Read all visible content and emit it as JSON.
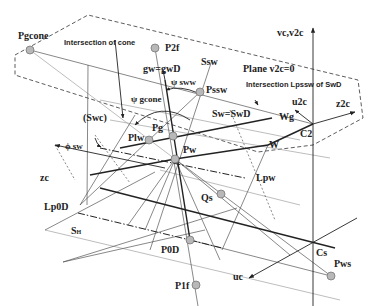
{
  "figure": {
    "type": "3D geometry diagram of cone / gear tooth surfaces",
    "points": [
      {
        "id": "Pgcone",
        "label": "Pgcone"
      },
      {
        "id": "P2f",
        "label": "P2f"
      },
      {
        "id": "Pssw",
        "label": "Pssw"
      },
      {
        "id": "Pg",
        "label": "Pg"
      },
      {
        "id": "Plw",
        "label": "Plw"
      },
      {
        "id": "Pw",
        "label": "Pw"
      },
      {
        "id": "Qs",
        "label": "Qs"
      },
      {
        "id": "P0D",
        "label": "P0D"
      },
      {
        "id": "P1f",
        "label": "P1f"
      },
      {
        "id": "Pws",
        "label": "Pws"
      }
    ],
    "labels": {
      "intersection_cone": "Intersection of cone",
      "intersection_lpssw": "Intersection Lpssw of SwD",
      "plane": "Plane v2c=0",
      "gw": "gw=gwD",
      "ssw": "Ssw",
      "sw": "Sw=SwD",
      "swc": "(Swc)",
      "psi_sww": "ψ sww",
      "psi_gcone": "ψ gcone",
      "phi_sw": "ϕ sw",
      "wg": "Wg",
      "w": "W",
      "c2": "C2",
      "cs": "Cs",
      "lpw": "Lpw",
      "lp0d": "Lp0D",
      "sh_main": "S",
      "sh_sub": "H"
    },
    "axes": {
      "vc": "vc,v2c",
      "u2c": "u2c",
      "z2c": "z2c",
      "zc": "zc",
      "uc": "uc"
    },
    "colors": {
      "line": "#222222",
      "thin": "#555555",
      "light": "#9a9a9a",
      "point_fill": "#b8b8b8",
      "point_stroke": "#777777"
    }
  }
}
